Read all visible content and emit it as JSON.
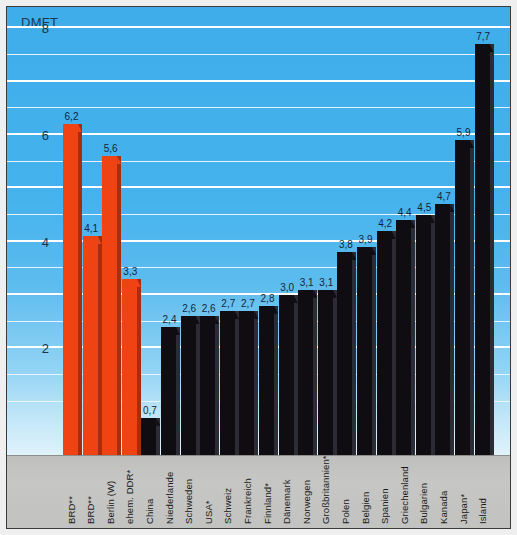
{
  "chart_data": {
    "type": "bar",
    "title": "",
    "ylabel": "DMFT",
    "xlabel": "",
    "ylim": [
      0,
      8.4
    ],
    "yticks": [
      2,
      4,
      6,
      8
    ],
    "ytick_labels": [
      "2",
      "4",
      "6",
      "8"
    ],
    "gridlines": [
      1,
      1.5,
      2,
      2.5,
      3,
      3.5,
      4,
      4.5,
      5,
      5.5,
      6,
      6.5,
      7,
      7.5,
      8
    ],
    "major_gridlines": [
      2,
      3,
      4,
      5,
      6,
      7,
      8
    ],
    "grid": true,
    "legend": "none",
    "categories": [
      "BRD**",
      "BRD**",
      "Berlin (W)",
      "ehem. DDR*",
      "China",
      "Niederlande",
      "Schweden",
      "USA*",
      "Schweiz",
      "Frankreich",
      "Finnland*",
      "Dänemark",
      "Norwegen",
      "Großbritannien*",
      "Polen",
      "Belgien",
      "Spanien",
      "Griechenland",
      "Bulgarien",
      "Kanada",
      "Japan*",
      "Island"
    ],
    "values": [
      6.2,
      4.1,
      5.6,
      3.3,
      0.7,
      2.4,
      2.6,
      2.6,
      2.7,
      2.7,
      2.8,
      3.0,
      3.1,
      3.1,
      3.8,
      3.9,
      4.2,
      4.4,
      4.5,
      4.7,
      5.9,
      7.7
    ],
    "value_labels": [
      "6,2",
      "4,1",
      "5,6",
      "3,3",
      "0,7",
      "2,4",
      "2,6",
      "2,6",
      "2,7",
      "2,7",
      "2,8",
      "3,0",
      "3,1",
      "3,1",
      "3,8",
      "3,9",
      "4,2",
      "4,4",
      "4,5",
      "4,7",
      "5,9",
      "7,7"
    ],
    "series_colors": {
      "highlight": "#ef4314",
      "standard": "#100d12"
    },
    "highlight_indices": [
      0,
      1,
      2,
      3
    ],
    "background_top": "#3eadea",
    "background_bottom": "#dff2fb",
    "gridline_color": "#ffffff",
    "label_band_color": "#c6c6c4"
  }
}
